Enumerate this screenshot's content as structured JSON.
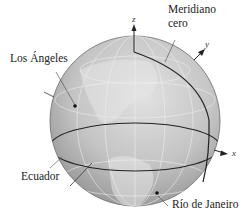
{
  "figure": {
    "type": "globe-diagram",
    "colors": {
      "globe_light": "#d9d9d9",
      "globe_mid": "#b9b9b9",
      "globe_dark": "#8f8f8f",
      "equator_line": "#222222",
      "grid_line": "#f2f2f2",
      "marker": "#111111"
    }
  },
  "labels": {
    "prime_meridian": [
      "Meridiano",
      "cero"
    ],
    "los_angeles": "Los Ángeles",
    "equator": "Ecuador",
    "rio": "Río de Janeiro"
  },
  "axes": {
    "z": "z",
    "y": "y",
    "x": "x"
  }
}
